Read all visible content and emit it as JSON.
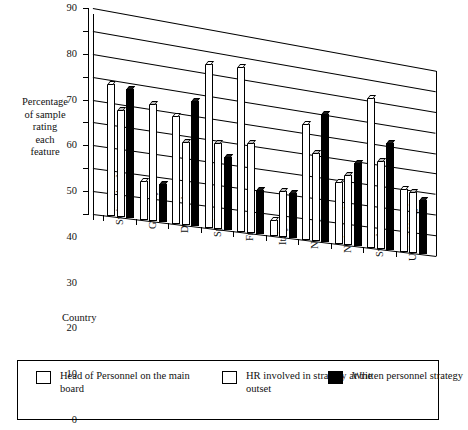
{
  "axis": {
    "y_label": "Percentage\nof sample\nrating\neach\nfeature",
    "y_label_lines": [
      "Percentage",
      "of sample",
      "rating",
      "each",
      "feature"
    ],
    "x_title": "Country",
    "y_ticks": [
      "0",
      "10",
      "20",
      "30",
      "40",
      "50",
      "60",
      "70",
      "80",
      "90"
    ]
  },
  "legend": {
    "items": [
      {
        "label": "Head of Personnel on the main board",
        "swatch": "white-square-icon",
        "color": "#ffffff"
      },
      {
        "label": "HR involved in strategy at the outset",
        "swatch": "dotted-square-icon",
        "color": "#bdbdbd"
      },
      {
        "label": "Written personnel strategy",
        "swatch": "black-square-icon",
        "color": "#000000"
      }
    ]
  },
  "chart_data": {
    "type": "bar",
    "title": "",
    "xlabel": "Country",
    "ylabel": "Percentage of sample rating each feature",
    "ylim": [
      0,
      90
    ],
    "ytick_step": 10,
    "grid": true,
    "legend_position": "bottom",
    "projection": "3d-perspective",
    "categories": [
      "Switzerland",
      "Germany",
      "Denmark",
      "Spain",
      "France",
      "Italy",
      "Norway",
      "Netherlands",
      "Sweden",
      "United Kingdom"
    ],
    "series": [
      {
        "name": "Head of Personnel on the main board",
        "values": [
          58,
          17,
          48,
          74,
          75,
          7,
          54,
          29,
          71,
          30
        ]
      },
      {
        "name": "HR involved in strategy at the outset",
        "values": [
          47,
          52,
          37,
          39,
          41,
          21,
          41,
          33,
          42,
          29
        ]
      },
      {
        "name": "Written personnel strategy",
        "values": [
          57,
          17,
          56,
          33,
          20,
          21,
          60,
          39,
          51,
          26
        ]
      }
    ]
  }
}
